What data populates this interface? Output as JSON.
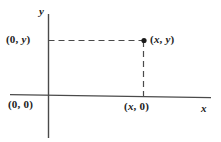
{
  "figure": {
    "type": "coordinate-diagram",
    "background_color": "#ffffff",
    "ink_color": "#3a3a3a",
    "text_color": "#1c1c1c"
  },
  "axes": {
    "x_axis_name": "x",
    "y_axis_name": "y"
  },
  "labels": {
    "origin": "(0, 0)",
    "y_intercept": "(0, y)",
    "x_intercept": "(x, 0)",
    "point": "(x, y)"
  },
  "chart_data": {
    "type": "scatter",
    "title": "",
    "xlabel": "x",
    "ylabel": "y",
    "grid": false,
    "legend": null,
    "annotations": [
      {
        "name": "origin",
        "text": "(0, 0)",
        "x": 0,
        "y": 0
      },
      {
        "name": "y-intercept",
        "text": "(0, y)",
        "x": 0,
        "y": 1
      },
      {
        "name": "x-intercept",
        "text": "(x, 0)",
        "x": 1,
        "y": 0
      },
      {
        "name": "point",
        "text": "(x, y)",
        "x": 1,
        "y": 1
      }
    ],
    "points": [
      {
        "x": 1,
        "y": 1,
        "label": "(x, y)",
        "marker": "filled-dot"
      }
    ],
    "guides": [
      {
        "name": "horizontal-projection",
        "style": "dashed",
        "from": [
          0,
          1
        ],
        "to": [
          1,
          1
        ]
      },
      {
        "name": "vertical-projection",
        "style": "dashed",
        "from": [
          1,
          1
        ],
        "to": [
          1,
          0
        ]
      }
    ]
  }
}
